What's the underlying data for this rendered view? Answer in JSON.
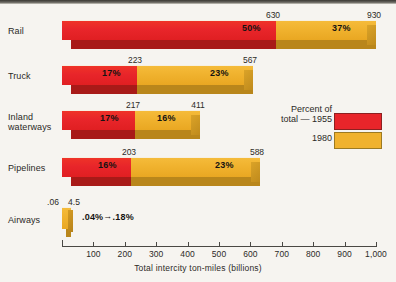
{
  "chart_data": {
    "type": "bar",
    "orientation": "horizontal",
    "stacked_mode": "overlapping-1955-inside-1980",
    "title": "",
    "xlabel": "Total intercity ton-miles (billions)",
    "ylabel": "",
    "xlim": [
      0,
      1000
    ],
    "xticks": [
      100,
      200,
      300,
      400,
      500,
      600,
      700,
      800,
      900,
      1000
    ],
    "xtick_labels": [
      "100",
      "200",
      "300",
      "400",
      "500",
      "600",
      "700",
      "800",
      "900",
      "1,000"
    ],
    "grid": false,
    "categories": [
      "Rail",
      "Truck",
      "Inland waterways",
      "Pipelines",
      "Airways"
    ],
    "series": [
      {
        "name": "1955",
        "color": "#e8252a",
        "values": [
          630,
          223,
          217,
          203,
          0.06
        ]
      },
      {
        "name": "1980",
        "color": "#f0b22e",
        "values": [
          930,
          567,
          411,
          588,
          4.5
        ]
      }
    ],
    "percent_labels": {
      "1955": [
        "50%",
        "17%",
        "17%",
        "16%",
        ".04%"
      ],
      "1980": [
        "37%",
        "23%",
        "16%",
        "23%",
        ".18%"
      ]
    },
    "value_labels": {
      "1955": [
        "630",
        "223",
        "217",
        "203",
        ".06"
      ],
      "1980": [
        "930",
        "567",
        "411",
        "588",
        "4.5"
      ]
    },
    "legend": {
      "position": "right-middle",
      "title": "Percent of total",
      "entries": [
        {
          "label": "Percent of\ntotal — 1955",
          "color": "#e8252a"
        },
        {
          "label": "1980",
          "color": "#f0b22e"
        }
      ]
    }
  },
  "rows": [
    {
      "category": "Rail",
      "label_line1": "Rail",
      "label_line2": "",
      "red_value": 630,
      "red_label": "630",
      "red_pct": "50%",
      "gold_value": 930,
      "gold_label": "930",
      "gold_pct": "37%"
    },
    {
      "category": "Truck",
      "label_line1": "Truck",
      "label_line2": "",
      "red_value": 223,
      "red_label": "223",
      "red_pct": "17%",
      "gold_value": 567,
      "gold_label": "567",
      "gold_pct": "23%"
    },
    {
      "category": "Inland waterways",
      "label_line1": "Inland",
      "label_line2": "waterways",
      "red_value": 217,
      "red_label": "217",
      "red_pct": "17%",
      "gold_value": 411,
      "gold_label": "411",
      "gold_pct": "16%"
    },
    {
      "category": "Pipelines",
      "label_line1": "Pipelines",
      "label_line2": "",
      "red_value": 203,
      "red_label": "203",
      "red_pct": "16%",
      "gold_value": 588,
      "gold_label": "588",
      "gold_pct": "23%"
    },
    {
      "category": "Airways",
      "label_line1": "Airways",
      "label_line2": "",
      "red_value": 0.06,
      "red_label": ".06",
      "red_pct": ".04%",
      "gold_value": 4.5,
      "gold_label": "4.5",
      "gold_pct": ".18%"
    }
  ],
  "airways_note": {
    "from": ".04%",
    "arrow": "→",
    "to": ".18%"
  },
  "axis": {
    "title": "Total intercity ton-miles (billions)",
    "ticks": [
      "100",
      "200",
      "300",
      "400",
      "500",
      "600",
      "700",
      "800",
      "900",
      "1,000"
    ]
  },
  "legend": {
    "line1": "Percent of",
    "line2": "total — 1955",
    "line3": "1980"
  },
  "colors": {
    "red": "#e8252a",
    "red_shadow": "#a81a18",
    "gold": "#f0b22e",
    "gold_shadow": "#b9861b",
    "background": "#f6f4f0",
    "text": "#2b2926"
  }
}
